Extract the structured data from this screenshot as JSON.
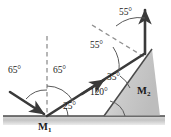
{
  "figure": {
    "type": "optics-reflection-diagram",
    "canvas": {
      "width": 171,
      "height": 137
    },
    "colors": {
      "ray": "#3a3a3a",
      "surface": "#555555",
      "normal_dashed": "#8a8a8a",
      "ground_fill": "#cfcfcf",
      "wedge_fill": "#c8c8c8",
      "label_text": "#1a1a1a",
      "arc": "#555555"
    },
    "mirrors": [
      {
        "id": "M1",
        "label": "M",
        "subscript": "1",
        "orientation": "horizontal"
      },
      {
        "id": "M2",
        "label": "M",
        "subscript": "2",
        "orientation": "inclined"
      }
    ],
    "angles": [
      {
        "id": "incidence-at-m1",
        "value": "65",
        "unit": "°",
        "text": "65°",
        "at": "M1",
        "measured_from": "normal"
      },
      {
        "id": "reflection-at-m1",
        "value": "65",
        "unit": "°",
        "text": "65°",
        "at": "M1",
        "measured_from": "normal"
      },
      {
        "id": "ray-above-ground",
        "value": "25",
        "unit": "°",
        "text": "25°",
        "at": "M1",
        "measured_from": "horizontal-surface"
      },
      {
        "id": "wedge-ground",
        "value": "120",
        "unit": "°",
        "text": "120°",
        "at": "incline-base",
        "measured_from": "horizontal-surface"
      },
      {
        "id": "incidence-at-m2",
        "value": "35",
        "unit": "°",
        "text": "35°",
        "at": "M2",
        "measured_from": "mirror-surface"
      },
      {
        "id": "normal-lower-m2",
        "value": "55",
        "unit": "°",
        "text": "55°",
        "at": "M2",
        "measured_from": "normal"
      },
      {
        "id": "normal-upper-m2",
        "value": "55",
        "unit": "°",
        "text": "55°",
        "at": "M2",
        "measured_from": "normal"
      }
    ],
    "labels": {
      "angle_65_left": "65°",
      "angle_65_right": "65°",
      "angle_25": "25°",
      "angle_120": "120°",
      "angle_35": "35°",
      "angle_55_lower": "55°",
      "angle_55_upper": "55°",
      "mirror_1_base": "M",
      "mirror_1_sub": "1",
      "mirror_2_base": "M",
      "mirror_2_sub": "2"
    }
  }
}
